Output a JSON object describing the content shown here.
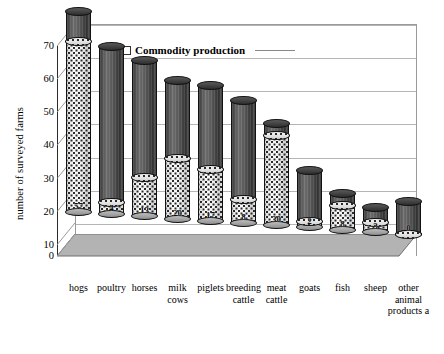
{
  "chart_data": {
    "type": "bar",
    "title": "",
    "subtitle": "",
    "xlabel": "",
    "ylabel": "number of surveyed farms",
    "ylim": [
      0,
      70
    ],
    "yticks": [
      0,
      10,
      20,
      30,
      40,
      50,
      60,
      70
    ],
    "grid": true,
    "legend_position": "top-center",
    "legend_entries": [
      "Commodity production"
    ],
    "categories": [
      "hogs",
      "poultry",
      "horses",
      "milk cows",
      "piglets",
      "breeding cattle",
      "meat cattle",
      "goats",
      "fish",
      "sheep",
      "other animal products a"
    ],
    "series": [
      {
        "name": "Commodity production",
        "values": [
          57,
          4,
          13,
          20,
          17,
          8,
          30,
          2,
          8,
          3,
          0
        ]
      },
      {
        "name": "Total surveyed farms",
        "values": [
          67,
          56,
          52,
          46,
          45,
          41,
          34,
          19,
          12,
          8,
          11
        ]
      }
    ],
    "data_labels": [
      "57",
      "4",
      "13",
      "20",
      "17",
      "8",
      "30",
      "2",
      "8",
      "3",
      "0"
    ]
  },
  "legend": {
    "label": "Commodity production",
    "swatch_name": "legend-swatch"
  },
  "axis": {
    "y_title": "number of surveyed farms",
    "tick_70": "70",
    "tick_60": "60",
    "tick_50": "50",
    "tick_40": "40",
    "tick_30": "30",
    "tick_20": "20",
    "tick_10": "10",
    "tick_0": "0"
  },
  "x_labels": [
    "hogs",
    "poultry",
    "horses",
    "milk\ncows",
    "piglets",
    "breeding\ncattle",
    "meat\ncattle",
    "goats",
    "fish",
    "sheep",
    "other\nanimal\nproducts a"
  ],
  "colors": {
    "dark_segment": "#4a4a4a",
    "light_segment": "#e8e8e8",
    "floor": "#b0b0b0",
    "gridline": "#b5b5b5",
    "axis": "#2b2b2b",
    "text": "#000000"
  }
}
